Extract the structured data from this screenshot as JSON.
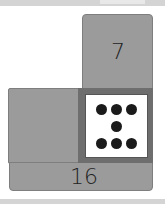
{
  "tiles": {
    "top": {
      "label": "7"
    },
    "left": {
      "label": ""
    },
    "bottom": {
      "label": "16"
    }
  },
  "die": {
    "pips": 7,
    "pip_layout": "3 top row, 1 center, 3 bottom row"
  },
  "colors": {
    "tile": "#9b9b9b",
    "die_frame": "#6e6e6e",
    "die_face": "#ffffff",
    "pip": "#1b1b1b"
  }
}
